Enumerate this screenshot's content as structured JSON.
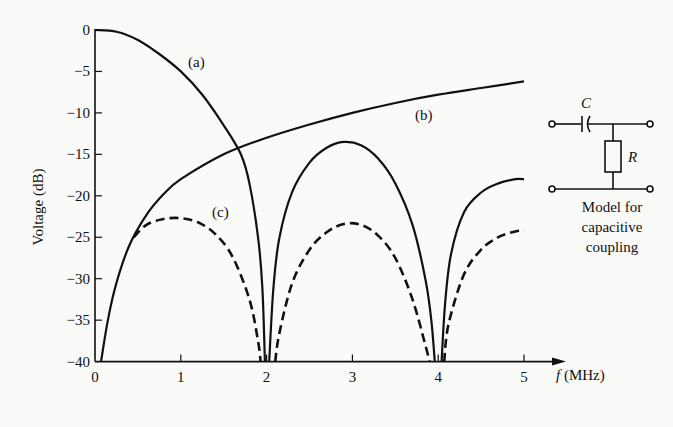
{
  "chart_data": {
    "type": "line",
    "title": "",
    "xlabel": "f (MHz)",
    "ylabel": "Voltage (dB)",
    "xlim": [
      0,
      5
    ],
    "ylim": [
      -40,
      0
    ],
    "x_ticks": [
      0,
      1,
      2,
      3,
      4,
      5
    ],
    "y_ticks": [
      0,
      -5,
      -10,
      -15,
      -20,
      -25,
      -30,
      -35,
      -40
    ],
    "grid": false,
    "series": [
      {
        "name": "(a)",
        "style": "solid",
        "x": [
          0,
          0.25,
          0.5,
          0.75,
          1.0,
          1.25,
          1.5,
          1.7,
          1.8,
          1.9,
          1.95,
          1.98
        ],
        "y": [
          0,
          -0.2,
          -1.2,
          -2.9,
          -5.0,
          -7.8,
          -11.5,
          -15.0,
          -18.5,
          -25.0,
          -31.0,
          -40
        ]
      },
      {
        "name": "(b)",
        "style": "solid",
        "x": [
          0.07,
          0.15,
          0.25,
          0.4,
          0.6,
          0.8,
          1.0,
          1.5,
          2.0,
          2.5,
          3.0,
          3.5,
          4.0,
          4.5,
          5.0
        ],
        "y": [
          -40,
          -35.0,
          -30.5,
          -26.0,
          -22.3,
          -19.8,
          -18.0,
          -15.0,
          -13.0,
          -11.4,
          -10.0,
          -8.8,
          -7.8,
          -7.0,
          -6.2
        ]
      },
      {
        "name": "solid lobes",
        "style": "solid",
        "x": [
          2.03,
          2.08,
          2.15,
          2.3,
          2.5,
          2.7,
          2.9,
          3.1,
          3.3,
          3.5,
          3.7,
          3.85,
          3.92,
          3.96,
          4.04,
          4.08,
          4.15,
          4.3,
          4.5,
          4.7,
          4.9,
          5.0
        ],
        "y": [
          -40,
          -31.0,
          -25.0,
          -19.5,
          -16.0,
          -14.2,
          -13.5,
          -13.9,
          -15.5,
          -18.5,
          -23.5,
          -30.0,
          -35.0,
          -40,
          -40,
          -33.0,
          -27.0,
          -22.0,
          -19.6,
          -18.5,
          -18.0,
          -18.0
        ]
      },
      {
        "name": "(c)",
        "style": "dashed",
        "x": [
          0.45,
          0.6,
          0.8,
          1.0,
          1.2,
          1.4,
          1.6,
          1.8,
          1.9,
          1.93,
          2.1,
          2.15,
          2.3,
          2.5,
          2.7,
          2.9,
          3.1,
          3.3,
          3.5,
          3.7,
          3.85,
          3.9,
          4.07,
          4.12,
          4.3,
          4.5,
          4.7,
          4.9,
          5.0
        ],
        "y": [
          -25.0,
          -23.5,
          -22.8,
          -22.7,
          -23.2,
          -24.6,
          -27.3,
          -32.5,
          -37.5,
          -40,
          -40,
          -36.5,
          -30.5,
          -26.5,
          -24.4,
          -23.4,
          -23.5,
          -24.8,
          -27.5,
          -32.5,
          -38.0,
          -40,
          -40,
          -35.5,
          -29.5,
          -26.5,
          -25.0,
          -24.3,
          -24.2
        ]
      }
    ],
    "annotations": [
      {
        "text": "(a)",
        "x": 1.2,
        "y": -3.9
      },
      {
        "text": "(b)",
        "x": 3.85,
        "y": -10.3
      },
      {
        "text": "(c)",
        "x": 1.5,
        "y": -22.0
      }
    ],
    "inset": {
      "type": "circuit",
      "components": [
        "C",
        "R"
      ],
      "caption": [
        "Model for",
        "capacitive",
        "coupling"
      ]
    }
  },
  "labels": {
    "ylabel": "Voltage (dB)",
    "xlabel_f": "f",
    "xlabel_unit": " (MHz)",
    "a": "(a)",
    "b": "(b)",
    "c": "(c)",
    "cap_C": "C",
    "res_R": "R",
    "caption1": "Model for",
    "caption2": "capacitive",
    "caption3": "coupling"
  }
}
